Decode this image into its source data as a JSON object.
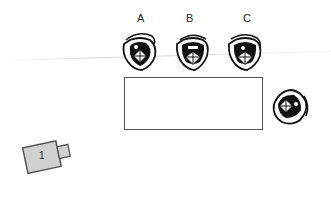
{
  "diagram": {
    "type": "seating-layout-top-view",
    "participants": [
      {
        "id": "A",
        "label": "A",
        "position": "behind table, left"
      },
      {
        "id": "B",
        "label": "B",
        "position": "behind table, center"
      },
      {
        "id": "C",
        "label": "C",
        "position": "behind table, right"
      },
      {
        "id": "D",
        "label": "",
        "position": "right end of table"
      }
    ],
    "table": {
      "shape": "rectangle"
    },
    "camera": {
      "label": "1"
    },
    "colors": {
      "outline": "#555555",
      "camera_fill": "#d0d0d0",
      "figure": "#111111"
    }
  }
}
